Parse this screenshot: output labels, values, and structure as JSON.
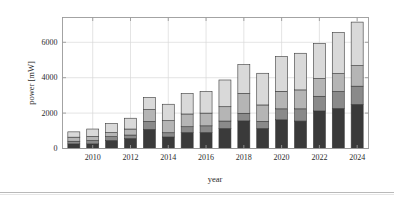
{
  "figure": {
    "background_color": "#ffffff",
    "axis_color": "#9a9a9a",
    "grid_color": "#d8d8d8",
    "rule_color": "#b9b9b9"
  },
  "chart_data": {
    "type": "bar",
    "stacked": true,
    "title": "",
    "xlabel": "year",
    "ylabel": "power [mW]",
    "ylim": [
      0,
      7400
    ],
    "yticks": [
      0,
      2000,
      4000,
      6000
    ],
    "ytick_labels": [
      "0",
      "2000",
      "4000",
      "6000"
    ],
    "xlim": [
      2008.4,
      2024.6
    ],
    "xticks": [
      2010,
      2012,
      2014,
      2016,
      2018,
      2020,
      2022,
      2024
    ],
    "xtick_labels": [
      "2010",
      "2012",
      "2014",
      "2016",
      "2018",
      "2020",
      "2022",
      "2024"
    ],
    "grid": true,
    "legend": "none",
    "categories": [
      2009,
      2010,
      2011,
      2012,
      2013,
      2014,
      2015,
      2016,
      2017,
      2018,
      2019,
      2020,
      2021,
      2022,
      2023,
      2024
    ],
    "series": [
      {
        "name": "segment-1",
        "color": "#3a3a3a",
        "values": [
          260,
          260,
          450,
          560,
          1080,
          650,
          900,
          900,
          1130,
          1560,
          1130,
          1620,
          1550,
          2120,
          2260,
          2490
        ]
      },
      {
        "name": "segment-2",
        "color": "#8a8a8a",
        "values": [
          150,
          190,
          220,
          200,
          450,
          240,
          330,
          380,
          420,
          430,
          400,
          620,
          690,
          830,
          960,
          1030
        ]
      },
      {
        "name": "segment-3",
        "color": "#b5b5b5",
        "values": [
          230,
          230,
          230,
          340,
          670,
          680,
          720,
          720,
          810,
          1120,
          930,
          990,
          1070,
          1000,
          1010,
          1160
        ]
      },
      {
        "name": "segment-4",
        "color": "#d9d9d9",
        "values": [
          300,
          420,
          520,
          610,
          690,
          930,
          1160,
          1230,
          1510,
          1630,
          1790,
          1970,
          2070,
          1990,
          2330,
          2460
        ]
      }
    ],
    "totals": [
      940,
      1100,
      1420,
      1710,
      2890,
      2500,
      3110,
      3230,
      3870,
      4740,
      4250,
      5200,
      5380,
      5940,
      6560,
      7140
    ]
  }
}
